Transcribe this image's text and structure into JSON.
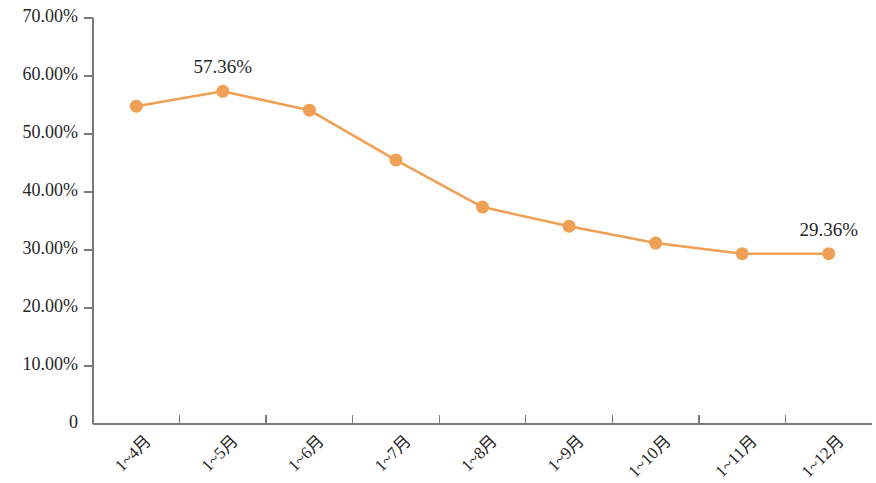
{
  "chart_data": {
    "type": "line",
    "title": "",
    "subtitle": "",
    "xlabel": "",
    "ylabel": "",
    "categories": [
      "1~4月",
      "1~5月",
      "1~6月",
      "1~7月",
      "1~8月",
      "1~9月",
      "1~10月",
      "1~11月",
      "1~12月"
    ],
    "values": [
      54.8,
      57.36,
      54.1,
      45.5,
      37.4,
      34.1,
      31.2,
      29.36,
      29.36
    ],
    "series": [
      {
        "name": "",
        "values": [
          54.8,
          57.36,
          54.1,
          45.5,
          37.4,
          34.1,
          31.2,
          29.36,
          29.36
        ]
      }
    ],
    "ylim": [
      0,
      70
    ],
    "xlim_categories": 9,
    "ytick_values": [
      0,
      10,
      20,
      30,
      40,
      50,
      60,
      70
    ],
    "ytick_labels": [
      "0",
      "10.00%",
      "20.00%",
      "30.00%",
      "40.00%",
      "50.00%",
      "60.00%",
      "70.00%"
    ],
    "grid": false,
    "legend": "none",
    "marker": "circle",
    "point_labels": [
      {
        "index": 1,
        "text": "57.36%"
      },
      {
        "index": 8,
        "text": "29.36%"
      }
    ],
    "colors": {
      "series_line": "#F0A055",
      "marker_fill": "#F0A055",
      "axis": "#7A7A7A",
      "text": "#262626",
      "background": "#FFFFFF"
    }
  },
  "axis": {
    "y_labels": [
      "70.00%",
      "60.00%",
      "50.00%",
      "40.00%",
      "30.00%",
      "20.00%",
      "10.00%",
      "0"
    ],
    "x_labels": [
      "1~4月",
      "1~5月",
      "1~6月",
      "1~7月",
      "1~8月",
      "1~9月",
      "1~10月",
      "1~11月",
      "1~12月"
    ]
  },
  "labels": {
    "peak": "57.36%",
    "last": "29.36%"
  }
}
